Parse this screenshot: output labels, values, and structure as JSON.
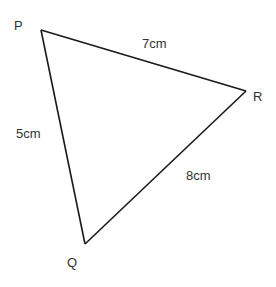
{
  "diagram": {
    "type": "triangle",
    "vertices": [
      {
        "name": "P",
        "x": 41,
        "y": 30,
        "label_x": 14,
        "label_y": 30
      },
      {
        "name": "R",
        "x": 246,
        "y": 91,
        "label_x": 253,
        "label_y": 101
      },
      {
        "name": "Q",
        "x": 85,
        "y": 244,
        "label_x": 67,
        "label_y": 267
      }
    ],
    "sides": [
      {
        "from": "P",
        "to": "R",
        "length": "7cm",
        "label_x": 142,
        "label_y": 48
      },
      {
        "from": "P",
        "to": "Q",
        "length": "5cm",
        "label_x": 16,
        "label_y": 138
      },
      {
        "from": "Q",
        "to": "R",
        "length": "8cm",
        "label_x": 186,
        "label_y": 180
      }
    ],
    "stroke_color": "#1a1a1a",
    "label_color": "#333333"
  }
}
